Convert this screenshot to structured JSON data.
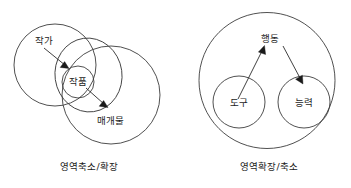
{
  "figure": {
    "background_color": "#ffffff",
    "stroke_color": "#3c3c3c",
    "text_color": "#1c1c1c",
    "arrow_color": "#1a1a1a"
  },
  "diagrams": [
    {
      "id": "left-diagram",
      "caption": "영역축소/확장",
      "nodes": [
        {
          "id": "jakga",
          "label": "작가"
        },
        {
          "id": "jakpum",
          "label": "작품"
        },
        {
          "id": "maegaemul",
          "label": "매개물"
        }
      ],
      "arrows": [
        {
          "from": "작가",
          "to": "작품"
        },
        {
          "from": "작품",
          "to": "매개물"
        }
      ]
    },
    {
      "id": "right-diagram",
      "caption": "영역확장/축소",
      "nodes": [
        {
          "id": "haengdong",
          "label": "행동"
        },
        {
          "id": "dogu",
          "label": "도구"
        },
        {
          "id": "neungryeok",
          "label": "능력"
        }
      ],
      "arrows": [
        {
          "from": "도구",
          "to": "행동"
        },
        {
          "from": "행동",
          "to": "능력"
        }
      ]
    }
  ]
}
